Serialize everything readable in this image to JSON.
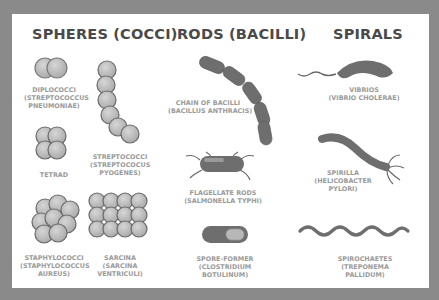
{
  "diagram": {
    "columns": [
      {
        "title": "SPHERES (COCCI)",
        "items": [
          {
            "name": "DIPLOCOCCI",
            "example": "(STREPTOCOCCUS",
            "example2": "PNEUMONIAE)"
          },
          {
            "name": "STREPTOCOCCI",
            "example": "(STREPTOCOCUS",
            "example2": "PYOGENES)"
          },
          {
            "name": "TETRAD"
          },
          {
            "name": "STAPHYLOCOCCI",
            "example": "(STAPHYLOCOCCUS",
            "example2": "AUREUS)"
          },
          {
            "name": "SARCINA",
            "example": "(SARCINA",
            "example2": "VENTRICULI)"
          }
        ]
      },
      {
        "title": "RODS (BACILLI)",
        "items": [
          {
            "name": "CHAIN OF BACILLI",
            "example": "(BACILLUS ANTHRACIS)"
          },
          {
            "name": "FLAGELLATE RODS",
            "example": "(SALMONELLA TYPHI)"
          },
          {
            "name": "SPORE-FORMER",
            "example": "(CLOSTRIDIUM",
            "example2": "BOTULINUM)"
          }
        ]
      },
      {
        "title": "SPIRALS",
        "items": [
          {
            "name": "VIBRIOS",
            "example": "(VIBRIO CHOLERAE)"
          },
          {
            "name": "SPIRILLA",
            "example": "(HELICOBACTER",
            "example2": "PYLORI)"
          },
          {
            "name": "SPIROCHAETES",
            "example": "(TREPONEMA",
            "example2": "PALLIDUM)"
          }
        ]
      }
    ],
    "colors": {
      "background": "#8a8a8a",
      "panel": "#ffffff",
      "title": "#4a4a4a",
      "label": "#9a9a9a",
      "cell_fill": "#b8b8b8",
      "cell_dark": "#6a6a6a"
    }
  }
}
